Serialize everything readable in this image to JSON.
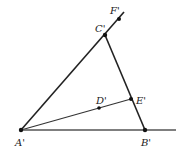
{
  "diagram": {
    "type": "geometry",
    "points": {
      "A": {
        "label": "A'",
        "x": 21,
        "y": 130
      },
      "B": {
        "label": "B'",
        "x": 145,
        "y": 130
      },
      "C": {
        "label": "C'",
        "x": 105,
        "y": 35
      },
      "D": {
        "label": "D'",
        "x": 99,
        "y": 108
      },
      "E": {
        "label": "E'",
        "x": 131,
        "y": 99
      },
      "F": {
        "label": "F'",
        "x": 119,
        "y": 19
      }
    },
    "segments": [
      {
        "from": "A",
        "to": "C",
        "extends_to": [
          124,
          12
        ]
      },
      {
        "from": "C",
        "to": "B"
      },
      {
        "from": "A",
        "to": "E"
      },
      {
        "from": "A",
        "to": "B",
        "extends_to": [
          176,
          130
        ]
      }
    ],
    "labels": {
      "A": "A'",
      "B": "B'",
      "C": "C'",
      "D": "D'",
      "E": "E'",
      "F": "F'"
    }
  }
}
